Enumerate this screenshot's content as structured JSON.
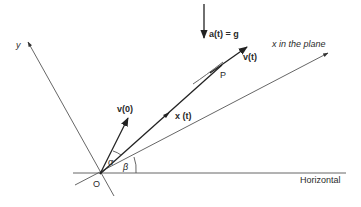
{
  "diagram": {
    "labels": {
      "y_axis": "y",
      "x_axis": "x in the plane",
      "accel": "a(t) = g",
      "velocity_t": "v(t)",
      "point": "P",
      "velocity_0": "v(0)",
      "position": "x (t)",
      "alpha": "α",
      "beta": "β",
      "origin": "O",
      "horizontal": "Horizontal"
    },
    "colors": {
      "ink": "#222222",
      "thin": "#555555",
      "background": "#ffffff"
    }
  }
}
